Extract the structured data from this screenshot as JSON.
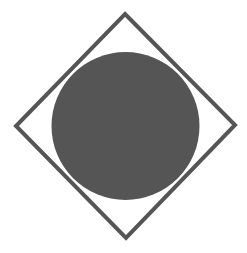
{
  "canvas": {
    "width": 247,
    "height": 253,
    "background": "#ffffff"
  },
  "shapes": {
    "circle": {
      "cx": 125.5,
      "cy": 126,
      "r": 74,
      "fill": "#555555"
    },
    "diamond": {
      "points": "125,14 235,125 126,238 16,126",
      "stroke": "#555555",
      "stroke_width": 4,
      "fill": "none"
    }
  }
}
